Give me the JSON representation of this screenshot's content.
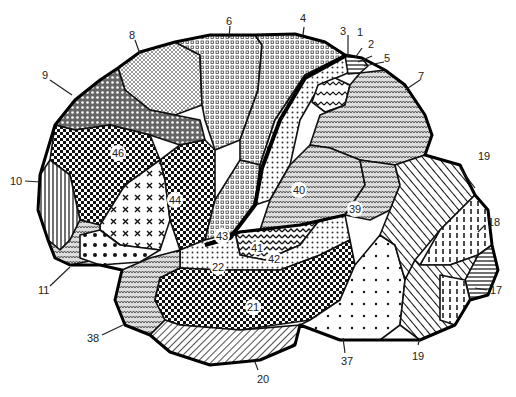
{
  "diagram": {
    "external_labels": [
      {
        "id": "1",
        "text": "1"
      },
      {
        "id": "2",
        "text": "2"
      },
      {
        "id": "3",
        "text": "3"
      },
      {
        "id": "4",
        "text": "4"
      },
      {
        "id": "5",
        "text": "5"
      },
      {
        "id": "6",
        "text": "6"
      },
      {
        "id": "7",
        "text": "7"
      },
      {
        "id": "8",
        "text": "8"
      },
      {
        "id": "9",
        "text": "9"
      },
      {
        "id": "10",
        "text": "10"
      },
      {
        "id": "11",
        "text": "11"
      },
      {
        "id": "17",
        "text": "17"
      },
      {
        "id": "18",
        "text": "18"
      },
      {
        "id": "19a",
        "text": "19"
      },
      {
        "id": "19b",
        "text": "19"
      },
      {
        "id": "20",
        "text": "20"
      },
      {
        "id": "37",
        "text": "37"
      },
      {
        "id": "38",
        "text": "38"
      }
    ],
    "internal_labels": [
      {
        "id": "46",
        "text": "46"
      },
      {
        "id": "44",
        "text": "44"
      },
      {
        "id": "43",
        "text": "43"
      },
      {
        "id": "40",
        "text": "40"
      },
      {
        "id": "39",
        "text": "39"
      },
      {
        "id": "41",
        "text": "41"
      },
      {
        "id": "42",
        "text": "42"
      },
      {
        "id": "22",
        "text": "22"
      },
      {
        "id": "21",
        "text": "21"
      }
    ]
  }
}
